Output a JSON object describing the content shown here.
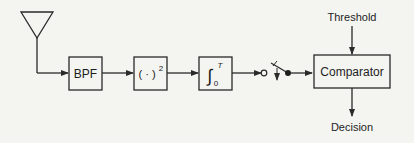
{
  "diagram": {
    "type": "block-diagram",
    "colors": {
      "background": "#f4f4f1",
      "stroke": "#2a2a2a",
      "text": "#1e1e1e"
    },
    "nodes": [
      {
        "id": "antenna",
        "label": "",
        "icon": "antenna-icon"
      },
      {
        "id": "bpf",
        "label": "BPF"
      },
      {
        "id": "squarer",
        "label": "( · )",
        "superscript": "2"
      },
      {
        "id": "integrator",
        "label": "∫",
        "upper_limit": "T",
        "lower_limit": "0"
      },
      {
        "id": "switch",
        "label": "",
        "icon": "sampling-switch-icon"
      },
      {
        "id": "comparator",
        "label": "Comparator"
      }
    ],
    "inputs": {
      "threshold": "Threshold"
    },
    "outputs": {
      "decision": "Decision"
    },
    "edges": [
      [
        "antenna",
        "bpf"
      ],
      [
        "bpf",
        "squarer"
      ],
      [
        "squarer",
        "integrator"
      ],
      [
        "integrator",
        "switch"
      ],
      [
        "switch",
        "comparator"
      ],
      [
        "threshold",
        "comparator"
      ],
      [
        "comparator",
        "decision"
      ]
    ]
  }
}
